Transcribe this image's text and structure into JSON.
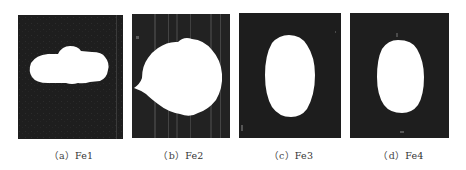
{
  "figure": {
    "panels": [
      {
        "id": "a",
        "caption_prefix": "（a）",
        "caption_label": "Fe1",
        "shape": "horizontal-elongated-blob"
      },
      {
        "id": "b",
        "caption_prefix": "（b）",
        "caption_label": "Fe2",
        "shape": "large-round-blob"
      },
      {
        "id": "c",
        "caption_prefix": "（c）",
        "caption_label": "Fe3",
        "shape": "vertical-ellipse"
      },
      {
        "id": "d",
        "caption_prefix": "（d）",
        "caption_label": "Fe4",
        "shape": "vertical-ellipse-small"
      }
    ],
    "colors": {
      "background": "#1c1c1c",
      "blob": "#ffffff",
      "caption": "#333333"
    }
  }
}
